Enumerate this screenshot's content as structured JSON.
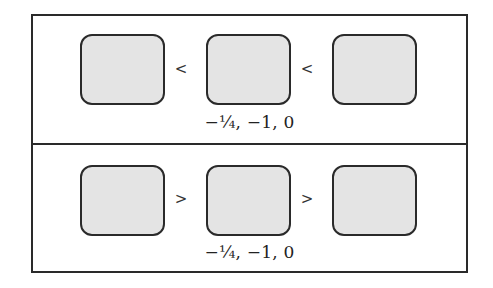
{
  "panels": [
    {
      "id": "top",
      "boxes": [
        "",
        "",
        ""
      ],
      "operators": [
        "<",
        "<"
      ],
      "caption": "−¼, −1, 0"
    },
    {
      "id": "bottom",
      "boxes": [
        "",
        "",
        ""
      ],
      "operators": [
        ">",
        ">"
      ],
      "caption": "−¼, −1, 0"
    }
  ],
  "colors": {
    "box_fill": "#e4e4e4",
    "border": "#2a2a2a",
    "background": "#ffffff"
  }
}
